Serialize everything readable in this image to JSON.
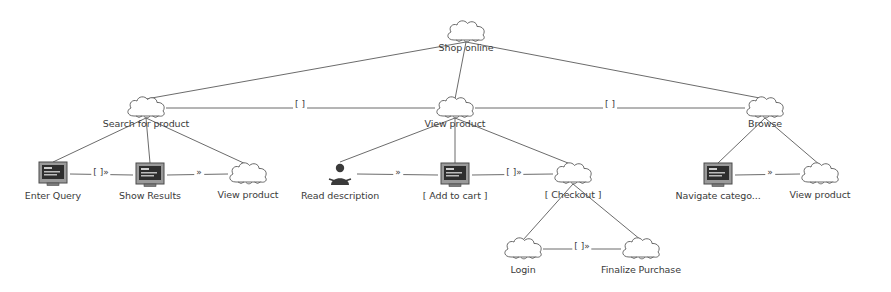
{
  "diagram": {
    "colors": {
      "stroke": "#5a5a5a",
      "text": "#3b3b3b",
      "background": "#ffffff",
      "screen_fill": "#8a8a8a"
    },
    "nodes": [
      {
        "id": "shop_online",
        "label": "Shop online",
        "type": "cloud",
        "x": 466,
        "y": 32,
        "cap_y": 42
      },
      {
        "id": "search_for_product",
        "label": "Search for product",
        "type": "cloud",
        "x": 146,
        "y": 108,
        "cap_y": 118
      },
      {
        "id": "view_product_mid",
        "label": "View product",
        "type": "cloud",
        "x": 455,
        "y": 108,
        "cap_y": 118
      },
      {
        "id": "browse",
        "label": "Browse",
        "type": "cloud",
        "x": 765,
        "y": 108,
        "cap_y": 118
      },
      {
        "id": "enter_query",
        "label": "Enter Query",
        "type": "screen",
        "x": 53,
        "y": 174,
        "cap_y": 190
      },
      {
        "id": "show_results",
        "label": "Show Results",
        "type": "screen",
        "x": 150,
        "y": 175,
        "cap_y": 190
      },
      {
        "id": "view_product_l",
        "label": "View product",
        "type": "cloud",
        "x": 248,
        "y": 174,
        "cap_y": 189
      },
      {
        "id": "read_description",
        "label": "Read description",
        "type": "actor",
        "x": 340,
        "y": 174,
        "cap_y": 190
      },
      {
        "id": "add_to_cart",
        "label": "[ Add to cart ]",
        "type": "screen",
        "x": 455,
        "y": 175,
        "cap_y": 190
      },
      {
        "id": "checkout",
        "label": "[ Checkout ]",
        "type": "cloud",
        "x": 573,
        "y": 174,
        "cap_y": 189
      },
      {
        "id": "navigate_category",
        "label": "Navigate catego...",
        "type": "screen",
        "x": 718,
        "y": 175,
        "cap_y": 190
      },
      {
        "id": "view_product_r",
        "label": "View product",
        "type": "cloud",
        "x": 820,
        "y": 174,
        "cap_y": 189
      },
      {
        "id": "login",
        "label": "Login",
        "type": "cloud",
        "x": 523,
        "y": 249,
        "cap_y": 264
      },
      {
        "id": "finalize_purchase",
        "label": "Finalize Purchase",
        "type": "cloud",
        "x": 641,
        "y": 249,
        "cap_y": 264
      }
    ],
    "edges": [
      {
        "from": "shop_online",
        "to": "search_for_product",
        "label": ""
      },
      {
        "from": "shop_online",
        "to": "view_product_mid",
        "label": ""
      },
      {
        "from": "shop_online",
        "to": "browse",
        "label": ""
      },
      {
        "from": "search_for_product",
        "to": "view_product_mid",
        "label": "[ ]",
        "label_x": 300,
        "label_y": 104
      },
      {
        "from": "view_product_mid",
        "to": "browse",
        "label": "[ ]",
        "label_x": 610,
        "label_y": 104
      },
      {
        "from": "search_for_product",
        "to": "enter_query",
        "label": ""
      },
      {
        "from": "search_for_product",
        "to": "show_results",
        "label": ""
      },
      {
        "from": "search_for_product",
        "to": "view_product_l",
        "label": ""
      },
      {
        "from": "enter_query",
        "to": "show_results",
        "label": "[ ]»",
        "label_x": 101,
        "label_y": 172
      },
      {
        "from": "show_results",
        "to": "view_product_l",
        "label": "»",
        "label_x": 199,
        "label_y": 172
      },
      {
        "from": "view_product_mid",
        "to": "read_description",
        "label": ""
      },
      {
        "from": "view_product_mid",
        "to": "add_to_cart",
        "label": ""
      },
      {
        "from": "view_product_mid",
        "to": "checkout",
        "label": ""
      },
      {
        "from": "read_description",
        "to": "add_to_cart",
        "label": "»",
        "label_x": 398,
        "label_y": 172
      },
      {
        "from": "add_to_cart",
        "to": "checkout",
        "label": "[ ]»",
        "label_x": 514,
        "label_y": 172
      },
      {
        "from": "browse",
        "to": "navigate_category",
        "label": ""
      },
      {
        "from": "browse",
        "to": "view_product_r",
        "label": ""
      },
      {
        "from": "navigate_category",
        "to": "view_product_r",
        "label": "»",
        "label_x": 770,
        "label_y": 172
      },
      {
        "from": "checkout",
        "to": "login",
        "label": ""
      },
      {
        "from": "checkout",
        "to": "finalize_purchase",
        "label": ""
      },
      {
        "from": "login",
        "to": "finalize_purchase",
        "label": "[ ]»",
        "label_x": 582,
        "label_y": 246
      }
    ]
  }
}
